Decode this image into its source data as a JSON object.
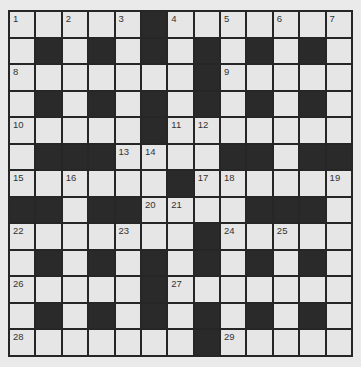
{
  "puzzle": {
    "rows": 13,
    "cols": 13,
    "colors": {
      "white_cell": "#e6e6e6",
      "black_cell": "#2a2a2a",
      "grid_line": "#262626",
      "background": "#eaeaea"
    },
    "layout": [
      "WWWWWBWWWWWWW",
      "WBWBWBWBWBWBW",
      "WWWWWWWBWWWWW",
      "WBWBWBWBWBWBW",
      "WWWWWBWWWWWWW",
      "WBBBWWWWBBWBB",
      "WWWWWWBWWWWWW",
      "BBWBBWWWWBBBW",
      "WWWWWWWBWWWWW",
      "WBWBWBWBWBWBW",
      "WWWWWBWWWWWWW",
      "WBWBWBWBWBWBW",
      "WWWWWWWBWWWWW"
    ],
    "numbers": [
      {
        "r": 0,
        "c": 0,
        "n": "1"
      },
      {
        "r": 0,
        "c": 2,
        "n": "2"
      },
      {
        "r": 0,
        "c": 4,
        "n": "3"
      },
      {
        "r": 0,
        "c": 6,
        "n": "4"
      },
      {
        "r": 0,
        "c": 8,
        "n": "5"
      },
      {
        "r": 0,
        "c": 10,
        "n": "6"
      },
      {
        "r": 0,
        "c": 12,
        "n": "7"
      },
      {
        "r": 2,
        "c": 0,
        "n": "8"
      },
      {
        "r": 2,
        "c": 8,
        "n": "9"
      },
      {
        "r": 4,
        "c": 0,
        "n": "10"
      },
      {
        "r": 4,
        "c": 6,
        "n": "11"
      },
      {
        "r": 4,
        "c": 7,
        "n": "12"
      },
      {
        "r": 5,
        "c": 4,
        "n": "13"
      },
      {
        "r": 5,
        "c": 5,
        "n": "14"
      },
      {
        "r": 6,
        "c": 0,
        "n": "15"
      },
      {
        "r": 6,
        "c": 2,
        "n": "16"
      },
      {
        "r": 6,
        "c": 7,
        "n": "17"
      },
      {
        "r": 6,
        "c": 8,
        "n": "18"
      },
      {
        "r": 6,
        "c": 12,
        "n": "19"
      },
      {
        "r": 7,
        "c": 5,
        "n": "20"
      },
      {
        "r": 7,
        "c": 6,
        "n": "21"
      },
      {
        "r": 8,
        "c": 0,
        "n": "22"
      },
      {
        "r": 8,
        "c": 4,
        "n": "23"
      },
      {
        "r": 8,
        "c": 8,
        "n": "24"
      },
      {
        "r": 8,
        "c": 10,
        "n": "25"
      },
      {
        "r": 10,
        "c": 0,
        "n": "26"
      },
      {
        "r": 10,
        "c": 6,
        "n": "27"
      },
      {
        "r": 12,
        "c": 0,
        "n": "28"
      },
      {
        "r": 12,
        "c": 8,
        "n": "29"
      }
    ],
    "entries": {}
  }
}
